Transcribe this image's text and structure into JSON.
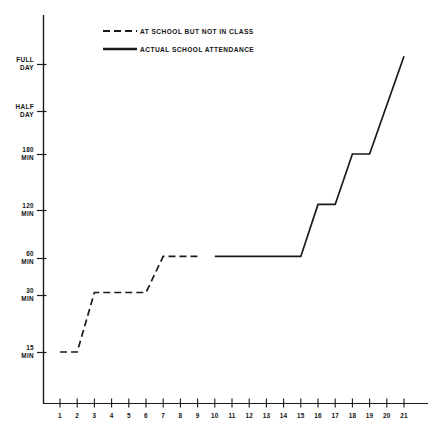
{
  "chart_data": {
    "type": "line",
    "title": "",
    "subtitle": "",
    "xlabel": "",
    "ylabel": "",
    "grid": false,
    "legend_position": "top-center",
    "x_tick_labels": [
      "1",
      "2",
      "3",
      "4",
      "5",
      "6",
      "7",
      "8",
      "9",
      "10",
      "11",
      "12",
      "13",
      "14",
      "15",
      "16",
      "17",
      "18",
      "19",
      "20",
      "21"
    ],
    "xlim": [
      0.6,
      21.6
    ],
    "y_tick_labels": [
      {
        "line1": "FULL",
        "line2": "DAY",
        "value": 420
      },
      {
        "line1": "HALF",
        "line2": "DAY",
        "value": 240
      },
      {
        "line1": "180",
        "line2": "MIN",
        "value": 180
      },
      {
        "line1": "120",
        "line2": "MIN",
        "value": 120
      },
      {
        "line1": "60",
        "line2": "MIN",
        "value": 60
      },
      {
        "line1": "30",
        "line2": "MIN",
        "value": 30
      },
      {
        "line1": "15",
        "line2": "MIN",
        "value": 15
      }
    ],
    "ylim": [
      0,
      470
    ],
    "series": [
      {
        "name": "AT SCHOOL BUT NOT IN CLASS",
        "style": "dashed",
        "color": "#1a1a1a",
        "points": [
          {
            "x": 1.0,
            "y": 15
          },
          {
            "x": 2.0,
            "y": 15
          },
          {
            "x": 3.0,
            "y": 32
          },
          {
            "x": 6.0,
            "y": 32
          },
          {
            "x": 7.0,
            "y": 62
          },
          {
            "x": 9.0,
            "y": 62
          }
        ]
      },
      {
        "name": "ACTUAL SCHOOL ATTENDANCE",
        "style": "solid",
        "color": "#1a1a1a",
        "points": [
          {
            "x": 10.0,
            "y": 62
          },
          {
            "x": 15.0,
            "y": 62
          },
          {
            "x": 16.0,
            "y": 126
          },
          {
            "x": 17.0,
            "y": 126
          },
          {
            "x": 18.0,
            "y": 180
          },
          {
            "x": 19.0,
            "y": 180
          },
          {
            "x": 21.0,
            "y": 450
          }
        ]
      }
    ]
  },
  "legend": {
    "items": [
      {
        "label": "AT SCHOOL BUT NOT IN CLASS",
        "style": "dashed"
      },
      {
        "label": "ACTUAL SCHOOL ATTENDANCE",
        "style": "solid"
      }
    ]
  },
  "axes": {
    "y_axis_name": "time-at-school-axis",
    "x_axis_name": "day-number-axis"
  }
}
